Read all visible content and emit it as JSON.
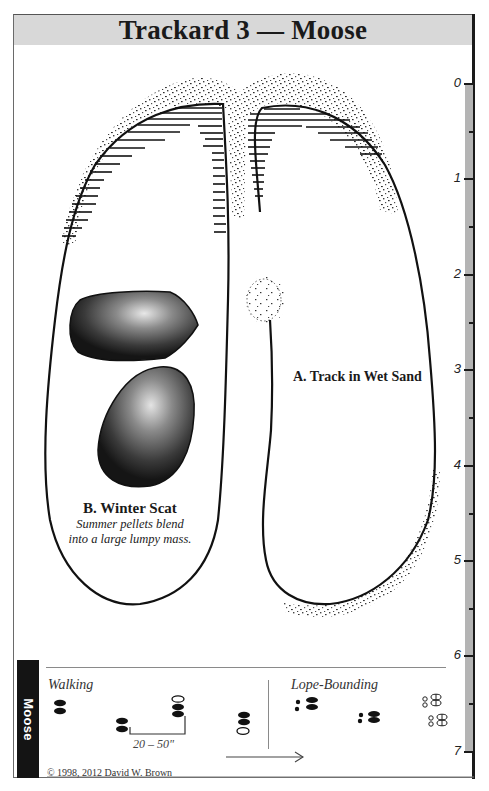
{
  "header": {
    "title": "Trackard 3 — Moose"
  },
  "ruler": {
    "unit_ticks": [
      {
        "label": "0",
        "y": 84
      },
      {
        "label": "1",
        "y": 179
      },
      {
        "label": "2",
        "y": 275
      },
      {
        "label": "3",
        "y": 370
      },
      {
        "label": "4",
        "y": 466
      },
      {
        "label": "5",
        "y": 561
      },
      {
        "label": "6",
        "y": 656
      },
      {
        "label": "7",
        "y": 752
      }
    ],
    "strip_color": "#b4b4b4"
  },
  "illustration": {
    "track_label": "A. Track in Wet Sand",
    "scat_label": "B. Winter Scat",
    "scat_caption_line1": "Summer pellets blend",
    "scat_caption_line2": "into a large lumpy mass."
  },
  "gaits": {
    "side_tab": "Moose",
    "walking_label": "Walking",
    "stride_measure": "20 – 50\"",
    "lope_label": "Lope-Bounding"
  },
  "footer": {
    "copyright": "© 1998, 2012 David W. Brown"
  },
  "colors": {
    "title_band": "#d8d8d8",
    "ink": "#1a1a1a",
    "side_tab": "#141414"
  }
}
